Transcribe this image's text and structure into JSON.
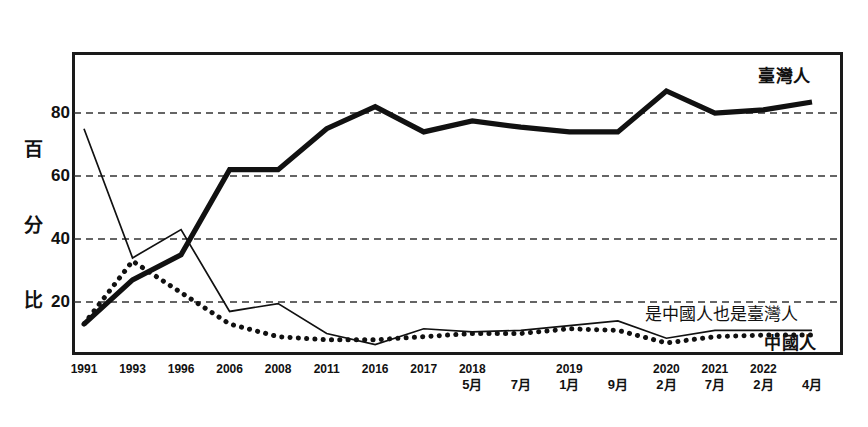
{
  "chart_data": {
    "type": "line",
    "title": "",
    "xlabel": "",
    "ylabel": "百分比",
    "ylim": [
      0,
      100
    ],
    "yticks": [
      20,
      40,
      60,
      80
    ],
    "grid": true,
    "legend_position": "inline-right",
    "categories": [
      "1991",
      "1993",
      "1996",
      "2006",
      "2008",
      "2011",
      "2016",
      "2017",
      "2018 5月",
      "7月",
      "2019 1月",
      "9月",
      "2020 2月",
      "2021 7月",
      "2022 2月",
      "4月"
    ],
    "x_tick_labels": [
      {
        "year": "1991",
        "month": ""
      },
      {
        "year": "1993",
        "month": ""
      },
      {
        "year": "1996",
        "month": ""
      },
      {
        "year": "2006",
        "month": ""
      },
      {
        "year": "2008",
        "month": ""
      },
      {
        "year": "2011",
        "month": ""
      },
      {
        "year": "2016",
        "month": ""
      },
      {
        "year": "2017",
        "month": ""
      },
      {
        "year": "2018",
        "month": "5月"
      },
      {
        "year": "",
        "month": "7月"
      },
      {
        "year": "2019",
        "month": "1月"
      },
      {
        "year": "",
        "month": "9月"
      },
      {
        "year": "2020",
        "month": "2月"
      },
      {
        "year": "2021",
        "month": "7月"
      },
      {
        "year": "2022",
        "month": "2月"
      },
      {
        "year": "",
        "month": "4月"
      }
    ],
    "series": [
      {
        "name": "臺灣人",
        "style": "thick-solid",
        "color": "#111111",
        "values": [
          13,
          27,
          35,
          62,
          62,
          75,
          82,
          74,
          77.5,
          75.5,
          74,
          74,
          87,
          80,
          81,
          83.5
        ]
      },
      {
        "name": "是中國人也是臺灣人",
        "style": "thin-solid",
        "color": "#111111",
        "values": [
          75,
          34,
          43,
          17,
          19.5,
          10,
          6.5,
          11.5,
          10.5,
          11,
          12.5,
          14,
          8.5,
          11,
          11,
          11
        ]
      },
      {
        "name": "中國人",
        "style": "dotted",
        "color": "#111111",
        "values": [
          13,
          33,
          23,
          13,
          9,
          8,
          8,
          9,
          10,
          10,
          11.5,
          11,
          7,
          9,
          9.5,
          9.5
        ]
      }
    ],
    "y_tick_labels": [
      "80",
      "60",
      "40",
      "20"
    ],
    "y_caption_chars": [
      "百",
      "分",
      "比"
    ],
    "series_labels": {
      "taiwanese": "臺灣人",
      "both": "是中國人也是臺灣人",
      "chinese": "中國人"
    },
    "colors": {
      "line": "#111111",
      "grid": "#333333",
      "frame": "#1a1a1a",
      "background": "#ffffff"
    }
  }
}
